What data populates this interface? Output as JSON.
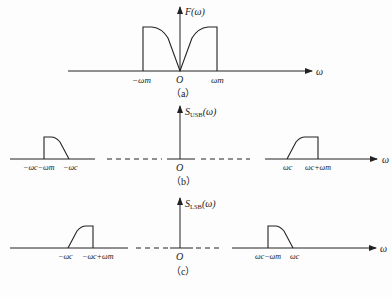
{
  "figure": {
    "panels": [
      {
        "id": "a",
        "caption": "（a）",
        "y_label": "F(ω)",
        "x_label": "ω",
        "origin_label": "O",
        "ticks": [
          "−ωm",
          "ωm"
        ],
        "description": "Baseband spectrum F(ω), symmetric, band-limited to ±ωm, zero at origin"
      },
      {
        "id": "b",
        "caption": "（b）",
        "y_label": "S_USB(ω)",
        "y_label_main": "S",
        "y_label_sub": "USB",
        "y_label_tail": "(ω)",
        "x_label": "ω",
        "origin_label": "O",
        "ticks_left": [
          "−ωc−ωm",
          "−ωc"
        ],
        "ticks_right": [
          "ωc",
          "ωc+ωm"
        ],
        "description": "Upper sideband spectrum"
      },
      {
        "id": "c",
        "caption": "（c）",
        "y_label": "S_LSB(ω)",
        "y_label_main": "S",
        "y_label_sub": "LSB",
        "y_label_tail": "(ω)",
        "x_label": "ω",
        "origin_label": "O",
        "ticks_left": [
          "−ωc",
          "−ωc+ωm"
        ],
        "ticks_right": [
          "ωc−ωm",
          "ωc"
        ],
        "description": "Lower sideband spectrum"
      }
    ]
  }
}
